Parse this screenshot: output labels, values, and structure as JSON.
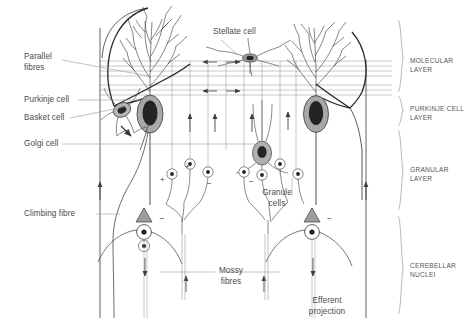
{
  "figure": {
    "background_color": "#ffffff",
    "ink_color": "#3a3a3a",
    "soma_fill": "#9c9c9c",
    "nucleus_fill": "#2b2b2b"
  },
  "labels": {
    "parallel_fibres": "Parallel\nfibres",
    "purkinje_cell": "Purkinje cell",
    "basket_cell": "Basket cell",
    "golgi_cell": "Golgi cell",
    "climbing_fibre": "Climbing fibre",
    "stellate_cell": "Stellate cell",
    "granule_cells": "Granule\ncells",
    "mossy_fibres": "Mossy\nfibres",
    "efferent_projection": "Efferent\nprojection"
  },
  "layers": [
    {
      "id": "molecular",
      "name": "MOLECULAR\nLAYER"
    },
    {
      "id": "purkinje",
      "name": "PURKINJE CELL\nLAYER"
    },
    {
      "id": "granular",
      "name": "GRANULAR\nLAYER"
    },
    {
      "id": "nuclei",
      "name": "CEREBELLAR\nNUCLEI"
    }
  ],
  "signs": {
    "excitatory": "+",
    "inhibitory": "−"
  },
  "sign_marks": [
    {
      "id": "granule-excitatory-left",
      "symbol": "+",
      "x": 160,
      "y": 176
    },
    {
      "id": "granule-excitatory-mid",
      "symbol": "+",
      "x": 185,
      "y": 163
    },
    {
      "id": "golgi-inhibitory-left",
      "symbol": "−",
      "x": 207,
      "y": 180
    },
    {
      "id": "golgi-inhibitory-right",
      "symbol": "−",
      "x": 249,
      "y": 178
    },
    {
      "id": "purkinje-terminal-left",
      "symbol": "−",
      "x": 160,
      "y": 215
    },
    {
      "id": "purkinje-terminal-right",
      "symbol": "−",
      "x": 327,
      "y": 215
    }
  ]
}
